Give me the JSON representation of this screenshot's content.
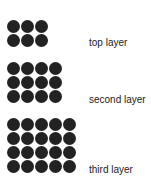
{
  "diagram": {
    "dot_color": "#222222",
    "layers": [
      {
        "label": "top layer",
        "cols": 3,
        "rows": 2,
        "count": 6
      },
      {
        "label": "second layer",
        "cols": 4,
        "rows": 3,
        "count": 12
      },
      {
        "label": "third layer",
        "cols": 5,
        "rows": 4,
        "count": 20
      }
    ]
  }
}
